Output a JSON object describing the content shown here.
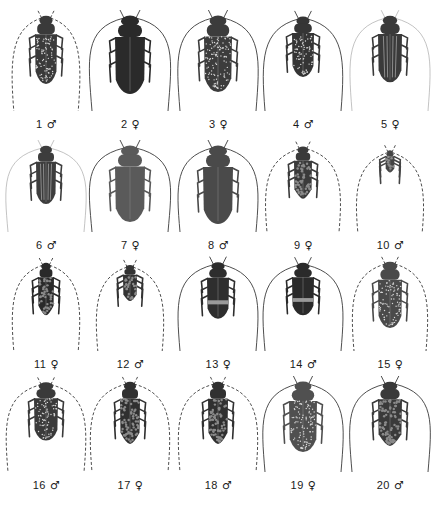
{
  "figure": {
    "type": "specimen-plate",
    "background": "#ffffff",
    "rows": 4,
    "columns": 5
  },
  "specimens": [
    {
      "number": "1",
      "sex": "♂",
      "row": 0,
      "col": 0,
      "body_len": 68,
      "body_w": 22,
      "tone": "#3a3a3a",
      "pattern": "speckled",
      "antenna": "annulated",
      "ant_spread": 0.9,
      "ant_len": 1.3
    },
    {
      "number": "2",
      "sex": "♀",
      "row": 0,
      "col": 1,
      "body_len": 78,
      "body_w": 30,
      "tone": "#2a2a2a",
      "pattern": "solid",
      "antenna": "solid",
      "ant_spread": 1.2,
      "ant_len": 1.3
    },
    {
      "number": "3",
      "sex": "♀",
      "row": 0,
      "col": 2,
      "body_len": 76,
      "body_w": 28,
      "tone": "#3c3c3c",
      "pattern": "speckled",
      "antenna": "solid",
      "ant_spread": 1.15,
      "ant_len": 1.25
    },
    {
      "number": "4",
      "sex": "♂",
      "row": 0,
      "col": 3,
      "body_len": 60,
      "body_w": 22,
      "tone": "#353535",
      "pattern": "speckled",
      "antenna": "solid",
      "ant_spread": 1.1,
      "ant_len": 1.4
    },
    {
      "number": "5",
      "sex": "♀",
      "row": 0,
      "col": 4,
      "body_len": 66,
      "body_w": 24,
      "tone": "#3a3a3a",
      "pattern": "striped",
      "antenna": "faint",
      "ant_spread": 1.15,
      "ant_len": 1.3
    },
    {
      "number": "6",
      "sex": "♂",
      "row": 1,
      "col": 0,
      "body_len": 58,
      "body_w": 20,
      "tone": "#3d3d3d",
      "pattern": "striped",
      "antenna": "faint",
      "ant_spread": 1.2,
      "ant_len": 1.3
    },
    {
      "number": "7",
      "sex": "♀",
      "row": 1,
      "col": 1,
      "body_len": 76,
      "body_w": 30,
      "tone": "#5a5a5a",
      "pattern": "solid",
      "antenna": "solid",
      "ant_spread": 1.2,
      "ant_len": 1.2
    },
    {
      "number": "8",
      "sex": "♂",
      "row": 1,
      "col": 2,
      "body_len": 78,
      "body_w": 30,
      "tone": "#4a4a4a",
      "pattern": "solid",
      "antenna": "solid",
      "ant_spread": 1.1,
      "ant_len": 1.3
    },
    {
      "number": "9",
      "sex": "♀",
      "row": 1,
      "col": 3,
      "body_len": 52,
      "body_w": 18,
      "tone": "#3a3a3a",
      "pattern": "mottled",
      "antenna": "dashed",
      "ant_spread": 1.0,
      "ant_len": 1.7
    },
    {
      "number": "10",
      "sex": "♂",
      "row": 1,
      "col": 4,
      "body_len": 22,
      "body_w": 9,
      "tone": "#444444",
      "pattern": "mottled",
      "antenna": "dashed",
      "ant_spread": 0.9,
      "ant_len": 4.0
    },
    {
      "number": "11",
      "sex": "♀",
      "row": 2,
      "col": 0,
      "body_len": 52,
      "body_w": 16,
      "tone": "#2a2a2a",
      "pattern": "mottled",
      "antenna": "dashed",
      "ant_spread": 0.9,
      "ant_len": 1.7
    },
    {
      "number": "12",
      "sex": "♂",
      "row": 2,
      "col": 1,
      "body_len": 36,
      "body_w": 14,
      "tone": "#333333",
      "pattern": "mottled",
      "antenna": "dashed",
      "ant_spread": 0.9,
      "ant_len": 2.4
    },
    {
      "number": "13",
      "sex": "♀",
      "row": 2,
      "col": 2,
      "body_len": 56,
      "body_w": 22,
      "tone": "#2e2e2e",
      "pattern": "banded",
      "antenna": "solid",
      "ant_spread": 1.15,
      "ant_len": 1.7
    },
    {
      "number": "14",
      "sex": "♂",
      "row": 2,
      "col": 3,
      "body_len": 52,
      "body_w": 22,
      "tone": "#2a2a2a",
      "pattern": "banded",
      "antenna": "solid",
      "ant_spread": 1.15,
      "ant_len": 1.8
    },
    {
      "number": "15",
      "sex": "♀",
      "row": 2,
      "col": 4,
      "body_len": 66,
      "body_w": 24,
      "tone": "#4a4a4a",
      "pattern": "speckled",
      "antenna": "annulated",
      "ant_spread": 1.0,
      "ant_len": 1.3
    },
    {
      "number": "16",
      "sex": "♂",
      "row": 3,
      "col": 0,
      "body_len": 58,
      "body_w": 24,
      "tone": "#3a3a3a",
      "pattern": "speckled",
      "antenna": "dashed",
      "ant_spread": 1.1,
      "ant_len": 1.55
    },
    {
      "number": "17",
      "sex": "♀",
      "row": 3,
      "col": 1,
      "body_len": 62,
      "body_w": 20,
      "tone": "#303030",
      "pattern": "mottled",
      "antenna": "dashed",
      "ant_spread": 1.1,
      "ant_len": 1.45
    },
    {
      "number": "18",
      "sex": "♂",
      "row": 3,
      "col": 2,
      "body_len": 62,
      "body_w": 20,
      "tone": "#303030",
      "pattern": "mottled",
      "antenna": "dashed",
      "ant_spread": 1.1,
      "ant_len": 1.45
    },
    {
      "number": "19",
      "sex": "♀",
      "row": 3,
      "col": 3,
      "body_len": 70,
      "body_w": 28,
      "tone": "#505050",
      "pattern": "speckled",
      "antenna": "solid",
      "ant_spread": 1.15,
      "ant_len": 1.3
    },
    {
      "number": "20",
      "sex": "♂",
      "row": 3,
      "col": 4,
      "body_len": 64,
      "body_w": 24,
      "tone": "#3a3a3a",
      "pattern": "mottled",
      "antenna": "solid",
      "ant_spread": 1.2,
      "ant_len": 1.3
    }
  ],
  "layout": {
    "col_centers": [
      46,
      130,
      218,
      303,
      390
    ],
    "row_tops": [
      12,
      142,
      258,
      378
    ],
    "label_y": [
      125,
      246,
      365,
      486
    ]
  }
}
